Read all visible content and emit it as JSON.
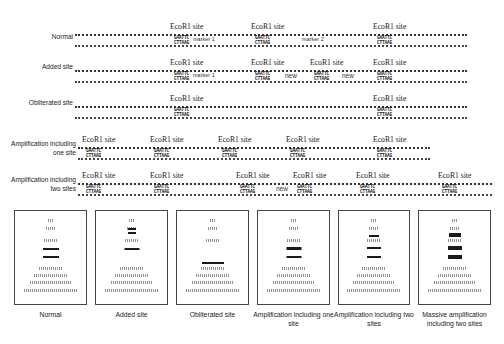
{
  "diagram": {
    "site_label": "EcoR1 site",
    "seq_top": "GAATTC",
    "seq_bottom": "CTTAAG",
    "rows": [
      {
        "id": "normal",
        "label": "Normal",
        "y": 34,
        "x1": 75,
        "x2": 467,
        "sites": [
          172,
          253,
          375
        ],
        "annotations": [
          {
            "text": "marker 1",
            "x": 193,
            "type": "marker"
          },
          {
            "text": "marker 2",
            "x": 302,
            "type": "marker"
          }
        ]
      },
      {
        "id": "added",
        "label": "Added site",
        "y": 70,
        "x1": 75,
        "x2": 467,
        "sites": [
          172,
          253,
          312,
          375
        ],
        "annotations": [
          {
            "text": "marker 1",
            "x": 193,
            "type": "marker"
          },
          {
            "text": "new",
            "x": 285,
            "type": "new"
          },
          {
            "text": "new",
            "x": 342,
            "type": "new"
          }
        ]
      },
      {
        "id": "obliterated",
        "label": "Obliterated site",
        "y": 106,
        "x1": 75,
        "x2": 467,
        "sites": [
          172,
          375
        ],
        "annotations": []
      },
      {
        "id": "amp-one",
        "label": "Amplification including one site",
        "y": 147,
        "x1": 78,
        "x2": 430,
        "sites": [
          84,
          152,
          220,
          288,
          375
        ],
        "annotations": []
      },
      {
        "id": "amp-two",
        "label": "Amplification including two sites",
        "y": 183,
        "x1": 78,
        "x2": 492,
        "sites": [
          84,
          152,
          238,
          295,
          358,
          440
        ],
        "annotations": [
          {
            "text": "new",
            "x": 276,
            "type": "new"
          }
        ]
      }
    ]
  },
  "gels": [
    {
      "id": "normal",
      "label": "Normal",
      "x": 14,
      "w": 73,
      "smears": [
        {
          "y": 8,
          "w": 6
        },
        {
          "y": 16,
          "w": 10
        },
        {
          "y": 28,
          "w": 14
        },
        {
          "y": 56,
          "w": 24
        },
        {
          "y": 63,
          "w": 34
        },
        {
          "y": 70,
          "w": 42
        },
        {
          "y": 78,
          "w": 54
        }
      ],
      "bands": [
        {
          "y": 37,
          "w": 16,
          "h": 2
        },
        {
          "y": 45,
          "w": 16,
          "h": 2
        }
      ]
    },
    {
      "id": "added",
      "label": "Added site",
      "x": 95,
      "w": 73,
      "smears": [
        {
          "y": 8,
          "w": 6
        },
        {
          "y": 16,
          "w": 10
        },
        {
          "y": 28,
          "w": 14
        },
        {
          "y": 56,
          "w": 24
        },
        {
          "y": 63,
          "w": 34
        },
        {
          "y": 70,
          "w": 42
        },
        {
          "y": 78,
          "w": 54
        }
      ],
      "bands": [
        {
          "y": 17,
          "w": 8,
          "h": 2
        },
        {
          "y": 21,
          "w": 8,
          "h": 2
        },
        {
          "y": 37,
          "w": 15,
          "h": 2
        }
      ]
    },
    {
      "id": "obliterated",
      "label": "Obliterated site",
      "x": 176,
      "w": 73,
      "smears": [
        {
          "y": 8,
          "w": 6
        },
        {
          "y": 16,
          "w": 10
        },
        {
          "y": 28,
          "w": 14
        },
        {
          "y": 56,
          "w": 24
        },
        {
          "y": 63,
          "w": 34
        },
        {
          "y": 70,
          "w": 42
        },
        {
          "y": 78,
          "w": 54
        }
      ],
      "bands": [
        {
          "y": 51,
          "w": 22,
          "h": 2
        }
      ]
    },
    {
      "id": "amp-one",
      "label": "Amplification including one site",
      "x": 257,
      "w": 73,
      "smears": [
        {
          "y": 8,
          "w": 6
        },
        {
          "y": 16,
          "w": 10
        },
        {
          "y": 28,
          "w": 14
        },
        {
          "y": 56,
          "w": 24
        },
        {
          "y": 63,
          "w": 34
        },
        {
          "y": 70,
          "w": 42
        },
        {
          "y": 78,
          "w": 54
        }
      ],
      "bands": [
        {
          "y": 36,
          "w": 15,
          "h": 3
        },
        {
          "y": 45,
          "w": 15,
          "h": 2
        }
      ]
    },
    {
      "id": "amp-two",
      "label": "Amplification including two sites",
      "x": 338,
      "w": 72,
      "smears": [
        {
          "y": 8,
          "w": 6
        },
        {
          "y": 16,
          "w": 10
        },
        {
          "y": 28,
          "w": 14
        },
        {
          "y": 56,
          "w": 24
        },
        {
          "y": 63,
          "w": 34
        },
        {
          "y": 70,
          "w": 42
        },
        {
          "y": 78,
          "w": 54
        }
      ],
      "bands": [
        {
          "y": 24,
          "w": 10,
          "h": 2
        },
        {
          "y": 36,
          "w": 14,
          "h": 2
        },
        {
          "y": 45,
          "w": 14,
          "h": 2
        }
      ]
    },
    {
      "id": "massive",
      "label": "Massive amplification including two sites",
      "x": 418,
      "w": 73,
      "smears": [
        {
          "y": 8,
          "w": 6
        },
        {
          "y": 16,
          "w": 10
        },
        {
          "y": 28,
          "w": 14
        },
        {
          "y": 56,
          "w": 24
        },
        {
          "y": 63,
          "w": 34
        },
        {
          "y": 70,
          "w": 42
        },
        {
          "y": 78,
          "w": 54
        }
      ],
      "bands": [
        {
          "y": 22,
          "w": 12,
          "h": 4
        },
        {
          "y": 35,
          "w": 14,
          "h": 4
        },
        {
          "y": 44,
          "w": 14,
          "h": 4
        }
      ]
    }
  ]
}
